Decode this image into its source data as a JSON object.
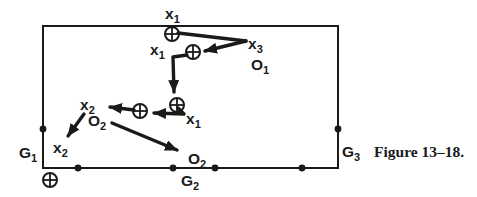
{
  "colors": {
    "ink": "#1a1a1a",
    "background": "#ffffff"
  },
  "figure": {
    "caption": "Figure 13–18."
  },
  "icons": {
    "circle_plus_icon": "⊕",
    "boundary_dot_icon": "●",
    "arrowhead_icon": "➤"
  },
  "diagram": {
    "labels": {
      "x1_top": {
        "base": "x",
        "sub": "1"
      },
      "x3": {
        "base": "x",
        "sub": "3"
      },
      "x1_left": {
        "base": "x",
        "sub": "1"
      },
      "o1": {
        "base": "O",
        "sub": "1"
      },
      "x2_upper": {
        "base": "x",
        "sub": "2"
      },
      "x1_mid": {
        "base": "x",
        "sub": "1"
      },
      "o2_upper": {
        "base": "O",
        "sub": "2"
      },
      "x2_lower": {
        "base": "x",
        "sub": "2"
      },
      "o2_lower": {
        "base": "O",
        "sub": "2"
      },
      "g1": {
        "base": "G",
        "sub": "1"
      },
      "g2": {
        "base": "G",
        "sub": "2"
      },
      "g3": {
        "base": "G",
        "sub": "3"
      }
    }
  }
}
